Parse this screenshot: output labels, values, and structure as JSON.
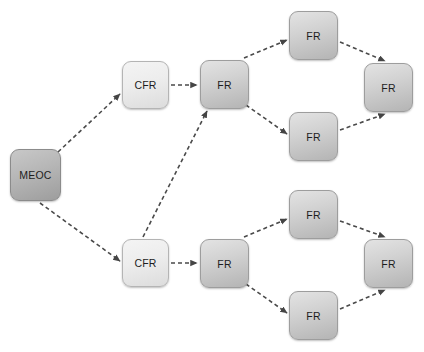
{
  "diagram": {
    "background_color": "#ffffff",
    "edge_color": "#4a4a4a",
    "edge_style": "dashed-with-arrowhead",
    "nodes": [
      {
        "id": "meoc",
        "label": "MEOC",
        "kind": "meoc",
        "x": 10,
        "y": 149,
        "w": 51,
        "h": 52,
        "fill": "#b4b4b4"
      },
      {
        "id": "cfr_top",
        "label": "CFR",
        "kind": "cfr",
        "x": 122,
        "y": 61,
        "w": 47,
        "h": 48,
        "fill": "#ededed"
      },
      {
        "id": "fr_t1",
        "label": "FR",
        "kind": "fr",
        "x": 200,
        "y": 60,
        "w": 49,
        "h": 49,
        "fill": "#d2d2d2"
      },
      {
        "id": "fr_t2",
        "label": "FR",
        "kind": "fr",
        "x": 289,
        "y": 11,
        "w": 49,
        "h": 49,
        "fill": "#d2d2d2"
      },
      {
        "id": "fr_t3",
        "label": "FR",
        "kind": "fr",
        "x": 289,
        "y": 112,
        "w": 49,
        "h": 49,
        "fill": "#d2d2d2"
      },
      {
        "id": "fr_t4",
        "label": "FR",
        "kind": "fr",
        "x": 364,
        "y": 63,
        "w": 49,
        "h": 49,
        "fill": "#d2d2d2"
      },
      {
        "id": "cfr_bot",
        "label": "CFR",
        "kind": "cfr",
        "x": 122,
        "y": 239,
        "w": 47,
        "h": 48,
        "fill": "#ededed"
      },
      {
        "id": "fr_b1",
        "label": "FR",
        "kind": "fr",
        "x": 200,
        "y": 239,
        "w": 49,
        "h": 49,
        "fill": "#d2d2d2"
      },
      {
        "id": "fr_b2",
        "label": "FR",
        "kind": "fr",
        "x": 289,
        "y": 190,
        "w": 49,
        "h": 49,
        "fill": "#d2d2d2"
      },
      {
        "id": "fr_b3",
        "label": "FR",
        "kind": "fr",
        "x": 289,
        "y": 291,
        "w": 49,
        "h": 49,
        "fill": "#d2d2d2"
      },
      {
        "id": "fr_b4",
        "label": "FR",
        "kind": "fr",
        "x": 364,
        "y": 239,
        "w": 49,
        "h": 49,
        "fill": "#d2d2d2"
      }
    ],
    "edges": [
      {
        "from": "meoc",
        "to": "cfr_top",
        "x1": 58,
        "y1": 152,
        "x2": 120,
        "y2": 94
      },
      {
        "from": "cfr_top",
        "to": "fr_t1",
        "x1": 171,
        "y1": 85,
        "x2": 197,
        "y2": 85
      },
      {
        "from": "fr_t1",
        "to": "fr_t2",
        "x1": 244,
        "y1": 58,
        "x2": 287,
        "y2": 40
      },
      {
        "from": "fr_t1",
        "to": "fr_t3",
        "x1": 246,
        "y1": 105,
        "x2": 287,
        "y2": 134
      },
      {
        "from": "fr_t2",
        "to": "fr_t4",
        "x1": 340,
        "y1": 42,
        "x2": 385,
        "y2": 61
      },
      {
        "from": "fr_t3",
        "to": "fr_t4",
        "x1": 340,
        "y1": 130,
        "x2": 385,
        "y2": 114
      },
      {
        "from": "meoc",
        "to": "cfr_bot",
        "x1": 40,
        "y1": 203,
        "x2": 120,
        "y2": 261
      },
      {
        "from": "cfr_bot",
        "to": "fr_t1",
        "x1": 143,
        "y1": 237,
        "x2": 207,
        "y2": 111
      },
      {
        "from": "cfr_bot",
        "to": "fr_b1",
        "x1": 171,
        "y1": 263,
        "x2": 197,
        "y2": 263
      },
      {
        "from": "fr_b1",
        "to": "fr_b2",
        "x1": 244,
        "y1": 237,
        "x2": 287,
        "y2": 219
      },
      {
        "from": "fr_b1",
        "to": "fr_b3",
        "x1": 246,
        "y1": 284,
        "x2": 287,
        "y2": 313
      },
      {
        "from": "fr_b2",
        "to": "fr_b4",
        "x1": 340,
        "y1": 221,
        "x2": 385,
        "y2": 237
      },
      {
        "from": "fr_b3",
        "to": "fr_b4",
        "x1": 340,
        "y1": 309,
        "x2": 385,
        "y2": 290
      }
    ]
  }
}
